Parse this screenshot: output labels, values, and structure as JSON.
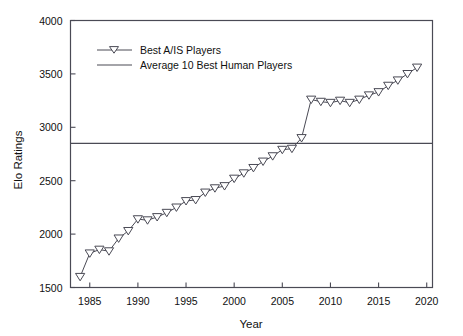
{
  "chart_data": {
    "type": "line",
    "title": "",
    "xlabel": "Year",
    "ylabel": "Elo Ratings",
    "xlim": [
      1983,
      2020.6
    ],
    "ylim": [
      1500,
      4000
    ],
    "xticks": [
      1985,
      1990,
      1995,
      2000,
      2005,
      2010,
      2015,
      2020
    ],
    "xtick_labels": [
      "1985",
      "1990",
      "1995",
      "2000",
      "2005",
      "2010",
      "2015",
      "2020"
    ],
    "yticks": [
      1500,
      2000,
      2500,
      3000,
      3500,
      4000
    ],
    "ytick_labels": [
      "1500",
      "2000",
      "2500",
      "3000",
      "3500",
      "4000"
    ],
    "grid": false,
    "legend_position": "upper-left-inside",
    "series": [
      {
        "name": "Best A/IS Players",
        "marker": "triangle-down-open",
        "color": "#4a4a55",
        "x": [
          1984,
          1985,
          1986,
          1987,
          1988,
          1989,
          1990,
          1991,
          1992,
          1993,
          1994,
          1995,
          1996,
          1997,
          1998,
          1999,
          2000,
          2001,
          2002,
          2003,
          2004,
          2005,
          2006,
          2007,
          2008,
          2009,
          2010,
          2011,
          2012,
          2013,
          2014,
          2015,
          2016,
          2017,
          2018,
          2019
        ],
        "values": [
          1600,
          1820,
          1855,
          1840,
          1960,
          2030,
          2140,
          2130,
          2160,
          2200,
          2250,
          2310,
          2320,
          2390,
          2430,
          2450,
          2520,
          2570,
          2620,
          2680,
          2730,
          2790,
          2800,
          2900,
          3260,
          3240,
          3230,
          3250,
          3230,
          3260,
          3300,
          3330,
          3390,
          3440,
          3500,
          3560
        ]
      },
      {
        "name": "Average 10 Best Human Players",
        "marker": "none",
        "color": "#4a4a55",
        "constant_value": 2850,
        "x": [
          1983,
          2020.6
        ],
        "values": [
          2850,
          2850
        ]
      }
    ],
    "legend_entries": [
      "Best A/IS Players",
      "Average 10 Best Human Players"
    ]
  }
}
